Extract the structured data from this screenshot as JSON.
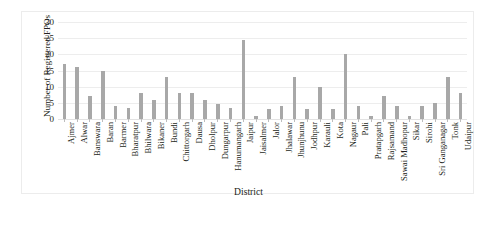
{
  "caption_strip": {
    "text": ""
  },
  "axes": {
    "y_title": "Number of Registered FPOs",
    "x_title": "District"
  },
  "chart_data": {
    "type": "bar",
    "title": "",
    "xlabel": "District",
    "ylabel": "Number of Registered FPOs",
    "ylim": [
      0,
      30
    ],
    "yticks": [
      0,
      5,
      10,
      15,
      20,
      25,
      30
    ],
    "grid": true,
    "legend": "none",
    "bar_color": "#a8a8a8",
    "categories": [
      "Ajmer",
      "Alwar",
      "Banswara",
      "Baran",
      "Barmer",
      "Bharatpur",
      "Bhilwara",
      "Bikaner",
      "Bundi",
      "Chittorgarh",
      "Dausa",
      "Dholpur",
      "Dungarpur",
      "Hanumangarh",
      "Jaipur",
      "Jaisalmer",
      "Jalor",
      "Jhalawar",
      "Jhunjhunu",
      "Jodhpur",
      "Karauli",
      "Kota",
      "Nagaur",
      "Pali",
      "Pratapgarh",
      "Rajsamand",
      "Sawai Madhopur",
      "Sikar",
      "Sirohi",
      "Sri Ganganagar",
      "Tonk",
      "Udaipur"
    ],
    "values": [
      17,
      16,
      7,
      15,
      4,
      3.5,
      8,
      6,
      13,
      8,
      8,
      6,
      4.5,
      3.5,
      24.5,
      1,
      3,
      4,
      13,
      3,
      10,
      3,
      20,
      4,
      1,
      7,
      4,
      1,
      4,
      5,
      13,
      8
    ]
  }
}
